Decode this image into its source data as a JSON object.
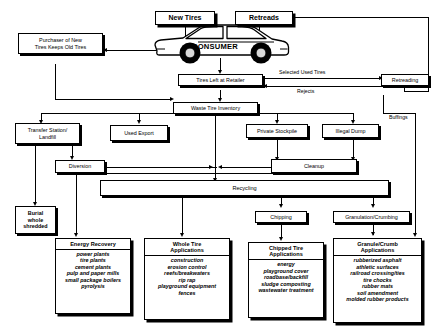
{
  "diagram": {
    "nodes": {
      "new_tires": "New Tires",
      "retreads": "Retreads",
      "consumer": "CONSUMER",
      "purchaser_line1": "Purchaser of New",
      "purchaser_line2": "Tires Keeps Old Tires",
      "tires_left_at_retailer": "Tires Left at Retailer",
      "retreading": "Retreading",
      "waste_tire_inventory": "Waste Tire Inventory",
      "transfer_station_line1": "Transfer Station/",
      "transfer_station_line2": "Landfill",
      "used_export": "Used Export",
      "private_stockpile": "Private Stockpile",
      "illegal_dump": "Illegal Dump",
      "diversion": "Diversion",
      "cleanup": "Cleanup",
      "recycling": "Recycling",
      "burial_line1": "Burial",
      "burial_line2": "whole",
      "burial_line3": "shredded",
      "chipping": "Chipping",
      "granulation_crumbing": "Granulation/Crumbing"
    },
    "edge_labels": {
      "selected_used_tires": "Selected Used Tires",
      "rejects": "Rejects",
      "buffings": "Buffings"
    },
    "application_boxes": [
      {
        "id": "energy-recovery",
        "heading": "Energy Recovery",
        "items": [
          "power plants",
          "tire plants",
          "cement plants",
          "pulp and paper mills",
          "small package boilers",
          "pyrolysis"
        ]
      },
      {
        "id": "whole-tire-applications",
        "heading": "Whole Tire\nApplications",
        "heading_line1": "Whole Tire",
        "heading_line2": "Applications",
        "items": [
          "construction",
          "erosion control",
          "reefs/breakwaters",
          "rip rap",
          "playground equipment",
          "fences"
        ]
      },
      {
        "id": "chipped-tire-applications",
        "heading_line1": "Chipped Tire",
        "heading_line2": "Applications",
        "items": [
          "energy",
          "playground cover",
          "roadbase/backfill",
          "sludge composting",
          "wastewater treatment"
        ]
      },
      {
        "id": "granule-crumb-applications",
        "heading_line1": "Granule/Crumb",
        "heading_line2": "Applications",
        "items": [
          "rubberized asphalt",
          "athletic surfaces",
          "railroad crossing/ties",
          "tire chocks",
          "rubber mats",
          "soil amendment",
          "molded rubber products"
        ]
      }
    ],
    "colors": {
      "ink": "#000000",
      "paper": "#ffffff"
    }
  }
}
